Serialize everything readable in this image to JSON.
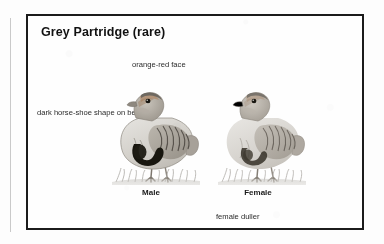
{
  "plate": {
    "title": "Grey Partridge (rare)",
    "annotations": {
      "face": "orange-red face",
      "belly": "dark horse-shoe shape on belly",
      "duller": "female duller"
    },
    "specimens": [
      {
        "label": "Male",
        "icon": "grey-partridge-male-illustration"
      },
      {
        "label": "Female",
        "icon": "grey-partridge-female-illustration"
      }
    ]
  },
  "colors": {
    "frame": "#1b1b1b",
    "page": "#fdfdfd",
    "text": "#2a2a2a",
    "gutter_rule": "#c9c9c9"
  }
}
